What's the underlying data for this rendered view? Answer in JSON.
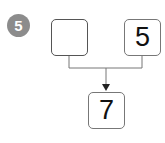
{
  "problem": {
    "number": "5",
    "left_box": "",
    "right_box": "5",
    "result_box": "7"
  },
  "colors": {
    "badge": "#8c8c8c",
    "line": "#777777"
  }
}
